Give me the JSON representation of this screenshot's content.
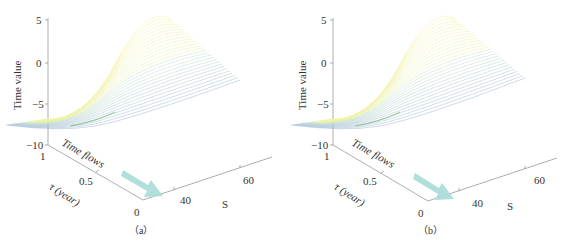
{
  "chart_data": [
    {
      "type": "surface3d-lines",
      "panel": "a",
      "caption": "（a）",
      "zlabel": "Time value",
      "xlabel": "S",
      "ylabel": "τ (year)",
      "annotation": "Time flows",
      "z_ticks": [
        "5",
        "0",
        "−5",
        "−10"
      ],
      "zlim": [
        -10,
        5
      ],
      "tau_ticks": [
        "1",
        "0.5",
        "0"
      ],
      "tau_range": [
        0,
        1
      ],
      "s_ticks": [
        "40",
        "60"
      ],
      "description": "Family of time-value curves vs S for tau in [0,1]; minimum near -7.5 at low S, rising to ~5 at high S; crest at tau≈1.",
      "colormap": [
        "#3a4fa0",
        "#5fb5a5",
        "#4caf50",
        "#d4e157",
        "#fff176"
      ],
      "arrow_color": "#a7dcd8"
    },
    {
      "type": "surface3d-lines",
      "panel": "b",
      "caption": "（b）",
      "zlabel": "Time value",
      "xlabel": "S",
      "ylabel": "τ (year)",
      "annotation": "Time flows",
      "z_ticks": [
        "5",
        "0",
        "−5",
        "−10"
      ],
      "zlim": [
        -10,
        5
      ],
      "tau_ticks": [
        "1",
        "0.5",
        "0"
      ],
      "tau_range": [
        0,
        1
      ],
      "s_ticks": [
        "40",
        "60"
      ],
      "description": "Similar family of curves, more uniform slopes; values from ~-7.5 up to ~5 with a smoother ridge.",
      "colormap": [
        "#3a4fa0",
        "#5fb5a5",
        "#4caf50",
        "#d4e157",
        "#fff176"
      ],
      "arrow_color": "#a7dcd8"
    }
  ],
  "panels": {
    "a": {
      "caption": "（a）",
      "zlabel": "Time value",
      "annotation": "Time flows",
      "tau_label": "τ (year)",
      "s_label": "S",
      "z_ticks": [
        "5",
        "0",
        "−5",
        "−10"
      ],
      "tau_ticks": [
        "1",
        "0.5",
        "0"
      ],
      "s_ticks": [
        "40",
        "60"
      ]
    },
    "b": {
      "caption": "（b）",
      "zlabel": "Time value",
      "annotation": "Time flows",
      "tau_label": "τ (year)",
      "s_label": "S",
      "z_ticks": [
        "5",
        "0",
        "−5",
        "−10"
      ],
      "tau_ticks": [
        "1",
        "0.5",
        "0"
      ],
      "s_ticks": [
        "40",
        "60"
      ]
    }
  }
}
